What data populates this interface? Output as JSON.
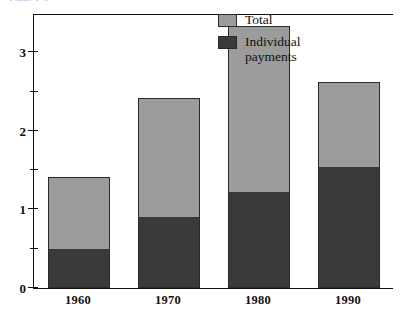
{
  "figure": {
    "clipped_caption": "Chart 1-5"
  },
  "legend": {
    "position": "top-right",
    "items": [
      {
        "label": "Total",
        "color": "#9c9c9c",
        "name": "legend-total"
      },
      {
        "label": "Individual\npayments",
        "color": "#3a3a3a",
        "name": "legend-individual-payments"
      }
    ]
  },
  "axis": {
    "y_ticks_major": [
      "0",
      "1",
      "2",
      "3"
    ],
    "y_minor_step": 0.5
  },
  "chart_data": {
    "type": "bar",
    "subtype": "stacked",
    "title": "",
    "xlabel": "",
    "ylabel": "",
    "ylim": [
      0,
      3.5
    ],
    "yticks": [
      0,
      1,
      2,
      3
    ],
    "yticks_minor": [
      0.5,
      1.5,
      2.5
    ],
    "grid": false,
    "legend_position": "top-right",
    "categories": [
      "1960",
      "1970",
      "1980",
      "1990"
    ],
    "series": [
      {
        "name": "Individual payments",
        "color": "#3a3a3a",
        "values": [
          0.5,
          0.9,
          1.22,
          1.54
        ]
      },
      {
        "name": "Total",
        "color": "#9c9c9c",
        "stacked_on": "Individual payments",
        "total_values": [
          1.41,
          2.42,
          3.34,
          2.62
        ],
        "values": [
          0.91,
          1.52,
          2.12,
          1.08
        ]
      }
    ]
  }
}
